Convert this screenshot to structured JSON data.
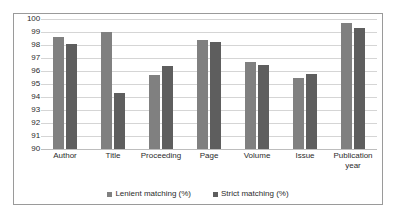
{
  "chart_data": {
    "type": "bar",
    "title": "",
    "xlabel": "",
    "ylabel": "",
    "ylim": [
      90,
      100
    ],
    "ystep": 1,
    "grid": true,
    "legend_position": "bottom",
    "categories": [
      "Author",
      "Title",
      "Proceeding",
      "Page",
      "Volume",
      "Issue",
      "Publication year"
    ],
    "ytick_labels": [
      "100",
      "99",
      "98",
      "97",
      "96",
      "95",
      "94",
      "93",
      "92",
      "91",
      "90"
    ],
    "series": [
      {
        "name": "Lenient matching (%)",
        "color": "#808080",
        "values": [
          98.6,
          99.0,
          95.7,
          98.4,
          96.7,
          95.5,
          99.7
        ]
      },
      {
        "name": "Strict matching (%)",
        "color": "#5e5e5e",
        "values": [
          98.1,
          94.3,
          96.4,
          98.2,
          96.5,
          95.8,
          99.3
        ]
      }
    ]
  }
}
